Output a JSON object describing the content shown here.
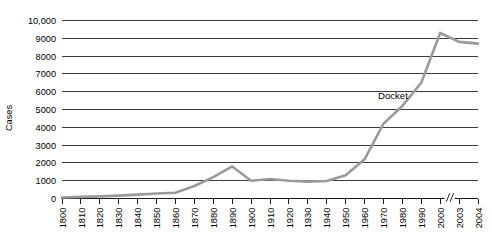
{
  "chart_data": {
    "type": "line",
    "title": "",
    "xlabel": "",
    "ylabel": "Cases",
    "ylim": [
      0,
      10000
    ],
    "grid": true,
    "legend": "none",
    "annotations": [
      {
        "text": "Docket",
        "x": 1975,
        "y": 5600
      }
    ],
    "axis_break": {
      "between": [
        "2000",
        "2003"
      ],
      "style": "double-slash"
    },
    "ytick_labels": [
      "0",
      "1000",
      "2000",
      "3000",
      "4000",
      "5000",
      "6000",
      "7000",
      "8000",
      "9000",
      "10,000"
    ],
    "ytick_values": [
      0,
      1000,
      2000,
      3000,
      4000,
      5000,
      6000,
      7000,
      8000,
      9000,
      10000
    ],
    "xtick_labels": [
      "1800",
      "1810",
      "1820",
      "1830",
      "1840",
      "1850",
      "1860",
      "1870",
      "1880",
      "1890",
      "1900",
      "1910",
      "1920",
      "1930",
      "1940",
      "1950",
      "1960",
      "1970",
      "1980",
      "1990",
      "2000",
      "2003",
      "2004"
    ],
    "series": [
      {
        "name": "Docket",
        "color": "#9a9a9a",
        "x": [
          "1800",
          "1810",
          "1820",
          "1830",
          "1840",
          "1850",
          "1860",
          "1870",
          "1880",
          "1890",
          "1900",
          "1910",
          "1920",
          "1930",
          "1940",
          "1950",
          "1960",
          "1970",
          "1980",
          "1990",
          "2000",
          "2003",
          "2004"
        ],
        "values": [
          60,
          90,
          120,
          160,
          220,
          280,
          320,
          700,
          1200,
          1800,
          1000,
          1100,
          1000,
          950,
          980,
          1300,
          2200,
          4200,
          5200,
          6500,
          9300,
          8800,
          8700
        ]
      }
    ]
  },
  "axis": {
    "y_title": "Cases"
  }
}
